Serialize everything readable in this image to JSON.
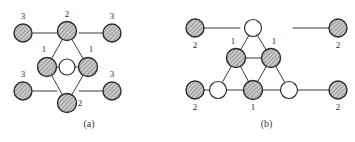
{
  "figure": {
    "width": 355,
    "height": 142,
    "background": "#ffffff",
    "stroke_color": "#3a3a3a",
    "hatch_fill": "#c9c9c9",
    "open_fill": "#ffffff",
    "label_color": "#2b2b2b"
  },
  "panels": [
    {
      "id": "a",
      "caption": "(a)",
      "node_labels": [
        "2",
        "3",
        "3",
        "1",
        "1",
        "3",
        "3",
        "2"
      ],
      "nodes": [
        {
          "name": "top-apex-node",
          "x": 67,
          "y": 31,
          "r": 9.5,
          "fill": "hatched",
          "label": "2",
          "label_x": 67,
          "label_y": 17,
          "label_anchor": "middle"
        },
        {
          "name": "outer-top-left-node",
          "x": 23,
          "y": 33,
          "r": 9.0,
          "fill": "hatched",
          "label": "3",
          "label_x": 23,
          "label_y": 19,
          "label_anchor": "middle"
        },
        {
          "name": "outer-top-right-node",
          "x": 112,
          "y": 33,
          "r": 9.0,
          "fill": "hatched",
          "label": "3",
          "label_x": 112,
          "label_y": 19,
          "label_anchor": "middle"
        },
        {
          "name": "left-inner-node",
          "x": 47,
          "y": 67,
          "r": 9.5,
          "fill": "hatched",
          "label": "1",
          "label_x": 44,
          "label_y": 52,
          "label_anchor": "middle"
        },
        {
          "name": "center-open-node",
          "x": 67,
          "y": 67,
          "r": 8.0,
          "fill": "open",
          "label": "",
          "label_x": 67,
          "label_y": 67,
          "label_anchor": "middle"
        },
        {
          "name": "right-inner-node",
          "x": 88,
          "y": 67,
          "r": 9.5,
          "fill": "hatched",
          "label": "1",
          "label_x": 91,
          "label_y": 52,
          "label_anchor": "middle"
        },
        {
          "name": "outer-bottom-left-node",
          "x": 23,
          "y": 91,
          "r": 9.0,
          "fill": "hatched",
          "label": "3",
          "label_x": 23,
          "label_y": 77,
          "label_anchor": "middle"
        },
        {
          "name": "outer-bottom-right-node",
          "x": 112,
          "y": 91,
          "r": 9.0,
          "fill": "hatched",
          "label": "3",
          "label_x": 112,
          "label_y": 77,
          "label_anchor": "middle"
        },
        {
          "name": "bottom-apex-node",
          "x": 67,
          "y": 103,
          "r": 9.5,
          "fill": "hatched",
          "label": "2",
          "label_x": 80,
          "label_y": 106,
          "label_anchor": "middle"
        }
      ],
      "edges": [
        {
          "name": "edge-top-to-left-inner",
          "x1": 67,
          "y1": 31,
          "x2": 47,
          "y2": 67
        },
        {
          "name": "edge-top-to-right-inner",
          "x1": 67,
          "y1": 31,
          "x2": 88,
          "y2": 67
        },
        {
          "name": "edge-left-inner-to-center",
          "x1": 47,
          "y1": 67,
          "x2": 67,
          "y2": 67
        },
        {
          "name": "edge-center-to-right-inner",
          "x1": 67,
          "y1": 67,
          "x2": 88,
          "y2": 67
        },
        {
          "name": "edge-left-inner-to-bottom",
          "x1": 47,
          "y1": 67,
          "x2": 67,
          "y2": 103
        },
        {
          "name": "edge-right-inner-to-bottom",
          "x1": 88,
          "y1": 67,
          "x2": 67,
          "y2": 103
        },
        {
          "name": "stub-top-left",
          "x1": 33,
          "y1": 33,
          "x2": 57,
          "y2": 33
        },
        {
          "name": "stub-top-right",
          "x1": 79,
          "y1": 33,
          "x2": 103,
          "y2": 33
        },
        {
          "name": "stub-bottom-left",
          "x1": 33,
          "y1": 91,
          "x2": 57,
          "y2": 91
        },
        {
          "name": "stub-bottom-right",
          "x1": 79,
          "y1": 91,
          "x2": 103,
          "y2": 91
        }
      ]
    },
    {
      "id": "b",
      "caption": "(b)",
      "node_labels": [
        "2",
        "2",
        "1",
        "1",
        "1",
        "2",
        "2"
      ],
      "nodes": [
        {
          "name": "outer-top-left-node",
          "x": 195,
          "y": 28,
          "r": 9.0,
          "fill": "hatched",
          "label": "2",
          "label_x": 195,
          "label_y": 48,
          "label_anchor": "middle"
        },
        {
          "name": "outer-top-right-node",
          "x": 338,
          "y": 28,
          "r": 9.0,
          "fill": "hatched",
          "label": "2",
          "label_x": 338,
          "label_y": 48,
          "label_anchor": "middle"
        },
        {
          "name": "triangle-apex-open-node",
          "x": 253,
          "y": 28,
          "r": 8.5,
          "fill": "open",
          "label": "",
          "label_x": 253,
          "label_y": 28,
          "label_anchor": "middle"
        },
        {
          "name": "mid-left-node",
          "x": 236,
          "y": 58,
          "r": 9.5,
          "fill": "hatched",
          "label": "1",
          "label_x": 233,
          "label_y": 44,
          "label_anchor": "middle"
        },
        {
          "name": "mid-right-node",
          "x": 271,
          "y": 58,
          "r": 9.5,
          "fill": "hatched",
          "label": "1",
          "label_x": 274,
          "label_y": 44,
          "label_anchor": "middle"
        },
        {
          "name": "bottom-left-open-node",
          "x": 218,
          "y": 90,
          "r": 8.5,
          "fill": "open",
          "label": "",
          "label_x": 218,
          "label_y": 90,
          "label_anchor": "middle"
        },
        {
          "name": "bottom-mid-node",
          "x": 253,
          "y": 90,
          "r": 9.5,
          "fill": "hatched",
          "label": "1",
          "label_x": 253,
          "label_y": 110,
          "label_anchor": "middle"
        },
        {
          "name": "bottom-right-open-node",
          "x": 289,
          "y": 90,
          "r": 8.5,
          "fill": "open",
          "label": "",
          "label_x": 289,
          "label_y": 90,
          "label_anchor": "middle"
        },
        {
          "name": "outer-bottom-left-node",
          "x": 195,
          "y": 90,
          "r": 9.0,
          "fill": "hatched",
          "label": "2",
          "label_x": 195,
          "label_y": 110,
          "label_anchor": "middle"
        },
        {
          "name": "outer-bottom-right-node",
          "x": 338,
          "y": 90,
          "r": 9.0,
          "fill": "hatched",
          "label": "2",
          "label_x": 338,
          "label_y": 110,
          "label_anchor": "middle"
        }
      ],
      "edges": [
        {
          "name": "edge-apex-to-mid-left",
          "x1": 253,
          "y1": 28,
          "x2": 236,
          "y2": 58
        },
        {
          "name": "edge-apex-to-mid-right",
          "x1": 253,
          "y1": 28,
          "x2": 271,
          "y2": 58
        },
        {
          "name": "edge-mid-left-to-mid-right",
          "x1": 236,
          "y1": 58,
          "x2": 271,
          "y2": 58
        },
        {
          "name": "edge-mid-left-to-bottom-left",
          "x1": 236,
          "y1": 58,
          "x2": 218,
          "y2": 90
        },
        {
          "name": "edge-mid-left-to-bottom-mid",
          "x1": 236,
          "y1": 58,
          "x2": 253,
          "y2": 90
        },
        {
          "name": "edge-mid-right-to-bottom-mid",
          "x1": 271,
          "y1": 58,
          "x2": 253,
          "y2": 90
        },
        {
          "name": "edge-mid-right-to-bottom-right",
          "x1": 271,
          "y1": 58,
          "x2": 289,
          "y2": 90
        },
        {
          "name": "edge-bottom-left-to-bottom-mid",
          "x1": 218,
          "y1": 90,
          "x2": 253,
          "y2": 90
        },
        {
          "name": "edge-bottom-mid-to-bottom-right",
          "x1": 253,
          "y1": 90,
          "x2": 289,
          "y2": 90
        },
        {
          "name": "stub-top-left",
          "x1": 204,
          "y1": 28,
          "x2": 240,
          "y2": 28
        },
        {
          "name": "stub-top-right",
          "x1": 293,
          "y1": 28,
          "x2": 329,
          "y2": 28
        },
        {
          "name": "stub-bottom-left",
          "x1": 204,
          "y1": 90,
          "x2": 210,
          "y2": 90
        },
        {
          "name": "stub-bottom-right",
          "x1": 297,
          "y1": 90,
          "x2": 329,
          "y2": 90
        }
      ]
    }
  ]
}
